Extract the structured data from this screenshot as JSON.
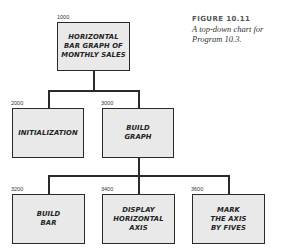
{
  "caption": {
    "title": "FIGURE 10.11",
    "body": "A top-down chart for\nProgram 10.3."
  },
  "nodes": [
    {
      "id": "1000",
      "label": "HORIZONTAL\nBAR GRAPH OF\nMONTHLY SALES",
      "parent": null
    },
    {
      "id": "2000",
      "label": "INITIALIZATION",
      "parent": "1000"
    },
    {
      "id": "3000",
      "label": "BUILD\nGRAPH",
      "parent": "1000"
    },
    {
      "id": "3200",
      "label": "BUILD\nBAR",
      "parent": "3000"
    },
    {
      "id": "3400",
      "label": "DISPLAY\nHORIZONTAL\nAXIS",
      "parent": "3000"
    },
    {
      "id": "3600",
      "label": "MARK\nTHE AXIS\nBY FIVES",
      "parent": "3000"
    }
  ],
  "colors": {
    "box_fill": "#e9e9e9",
    "line": "#2a2a2a"
  }
}
